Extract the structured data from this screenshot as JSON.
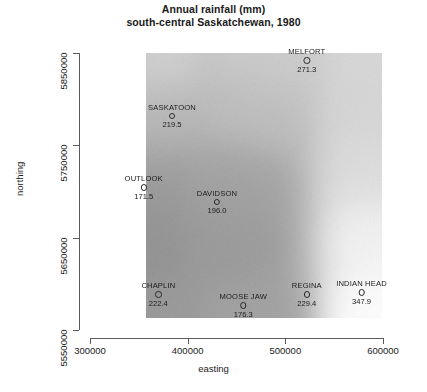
{
  "title": {
    "line1": "Annual rainfall (mm)",
    "line2": "south-central Saskatchewan, 1980"
  },
  "axes": {
    "x_label": "easting",
    "y_label": "northing",
    "x_ticks": [
      "300000",
      "400000",
      "500000",
      "600000"
    ],
    "y_ticks": [
      "5850000",
      "5750000",
      "5650000",
      "5550000"
    ]
  },
  "chart_data": {
    "type": "scatter",
    "title": "Annual rainfall (mm) south-central Saskatchewan, 1980",
    "xlabel": "easting",
    "ylabel": "northing",
    "xlim": [
      300000,
      600000
    ],
    "ylim": [
      5550000,
      5850000
    ],
    "grid": false,
    "legend": "none",
    "background": "grayscale interpolated rainfall surface raster",
    "value_units": "mm",
    "points": [
      {
        "name": "MELFORT",
        "value": "271.3",
        "x": 522000,
        "y": 5843000,
        "value_num": 271.3
      },
      {
        "name": "SASKATOON",
        "value": "219.5",
        "x": 384000,
        "y": 5783000,
        "value_num": 219.5
      },
      {
        "name": "OUTLOOK",
        "value": "171.5",
        "x": 355000,
        "y": 5706000,
        "value_num": 171.5
      },
      {
        "name": "DAVIDSON",
        "value": "196.0",
        "x": 430000,
        "y": 5690000,
        "value_num": 196.0
      },
      {
        "name": "CHAPLIN",
        "value": "222.4",
        "x": 370000,
        "y": 5590000,
        "value_num": 222.4
      },
      {
        "name": "MOOSE JAW",
        "value": "176.3",
        "x": 457000,
        "y": 5578000,
        "value_num": 176.3
      },
      {
        "name": "REGINA",
        "value": "229.4",
        "x": 522000,
        "y": 5590000,
        "value_num": 229.4
      },
      {
        "name": "INDIAN HEAD",
        "value": "347.9",
        "x": 578000,
        "y": 5592000,
        "value_num": 347.9
      }
    ]
  }
}
